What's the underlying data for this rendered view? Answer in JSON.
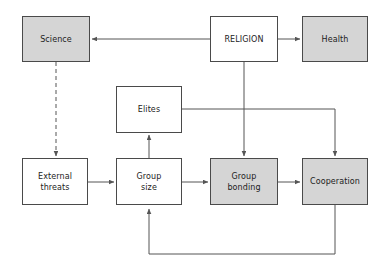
{
  "diagram": {
    "type": "flowchart",
    "canvas": {
      "width": 388,
      "height": 275,
      "background": "#ffffff"
    },
    "style": {
      "shaded_fill": "#d5d5d5",
      "plain_fill": "#ffffff",
      "border_color": "#4a4a4a",
      "edge_color": "#555555"
    },
    "nodes": [
      {
        "id": "science",
        "label": "Science",
        "fill": "shaded",
        "x": 22,
        "y": 16,
        "w": 68,
        "h": 46
      },
      {
        "id": "religion",
        "label": "RELIGION",
        "fill": "plain",
        "x": 210,
        "y": 16,
        "w": 68,
        "h": 46
      },
      {
        "id": "health",
        "label": "Health",
        "fill": "shaded",
        "x": 302,
        "y": 16,
        "w": 66,
        "h": 46
      },
      {
        "id": "elites",
        "label": "Elites",
        "fill": "plain",
        "x": 116,
        "y": 86,
        "w": 66,
        "h": 47
      },
      {
        "id": "external-threats",
        "label": "External\nthreats",
        "fill": "plain",
        "x": 22,
        "y": 158,
        "w": 66,
        "h": 47
      },
      {
        "id": "group-size",
        "label": "Group\nsize",
        "fill": "plain",
        "x": 116,
        "y": 158,
        "w": 66,
        "h": 47
      },
      {
        "id": "group-bonding",
        "label": "Group\nbonding",
        "fill": "shaded",
        "x": 210,
        "y": 158,
        "w": 68,
        "h": 47
      },
      {
        "id": "cooperation",
        "label": "Cooperation",
        "fill": "shaded",
        "x": 302,
        "y": 158,
        "w": 66,
        "h": 47
      }
    ],
    "edges": [
      {
        "id": "religion-to-science",
        "from": "religion",
        "to": "science",
        "style": "solid",
        "arrow": true
      },
      {
        "id": "religion-to-health",
        "from": "religion",
        "to": "health",
        "style": "solid",
        "arrow": true
      },
      {
        "id": "science-to-external-threats",
        "from": "science",
        "to": "external-threats",
        "style": "dashed",
        "arrow": true
      },
      {
        "id": "religion-to-group-bonding",
        "from": "religion",
        "to": "group-bonding",
        "style": "solid",
        "arrow": true
      },
      {
        "id": "elites-to-cooperation",
        "from": "elites",
        "to": "cooperation",
        "style": "solid",
        "arrow": true
      },
      {
        "id": "group-size-to-elites",
        "from": "group-size",
        "to": "elites",
        "style": "solid",
        "arrow": true
      },
      {
        "id": "external-threats-to-group-size",
        "from": "external-threats",
        "to": "group-size",
        "style": "solid",
        "arrow": true
      },
      {
        "id": "group-size-to-group-bonding",
        "from": "group-size",
        "to": "group-bonding",
        "style": "solid",
        "arrow": true
      },
      {
        "id": "group-bonding-to-cooperation",
        "from": "group-bonding",
        "to": "cooperation",
        "style": "solid",
        "arrow": true
      },
      {
        "id": "cooperation-to-group-size-feedback",
        "from": "cooperation",
        "to": "group-size",
        "style": "solid",
        "arrow": true
      }
    ]
  }
}
